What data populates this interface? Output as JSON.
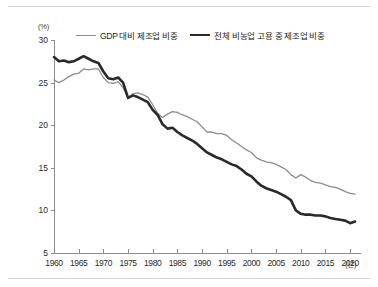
{
  "chart_data": {
    "type": "line",
    "title": "",
    "subtitle": "",
    "xlabel": "(년)",
    "ylabel": "(%)",
    "xlim": [
      1960,
      2022
    ],
    "ylim": [
      5,
      30
    ],
    "xticks": [
      1960,
      1965,
      1970,
      1975,
      1980,
      1985,
      1990,
      1995,
      2000,
      2005,
      2010,
      2015,
      2020
    ],
    "xtick_labels": [
      "1960",
      "1965",
      "1970",
      "1975",
      "1980",
      "1985",
      "1990",
      "1995",
      "2000",
      "2005",
      "2010",
      "2015",
      "2020"
    ],
    "yticks": [
      5,
      10,
      15,
      20,
      25,
      30
    ],
    "ytick_labels": [
      "5",
      "10",
      "15",
      "20",
      "25",
      "30"
    ],
    "grid": false,
    "legend_position": "top-center",
    "series": [
      {
        "name": "GDP 대비 제조업 비중",
        "color": "#8c8c8c",
        "line_width": 1.3,
        "x": [
          1960,
          1961,
          1962,
          1963,
          1964,
          1965,
          1966,
          1967,
          1968,
          1969,
          1970,
          1971,
          1972,
          1973,
          1974,
          1975,
          1976,
          1977,
          1978,
          1979,
          1980,
          1981,
          1982,
          1983,
          1984,
          1985,
          1986,
          1987,
          1988,
          1989,
          1990,
          1991,
          1992,
          1993,
          1994,
          1995,
          1996,
          1997,
          1998,
          1999,
          2000,
          2001,
          2002,
          2003,
          2004,
          2005,
          2006,
          2007,
          2008,
          2009,
          2010,
          2011,
          2012,
          2013,
          2014,
          2015,
          2016,
          2017,
          2018,
          2019,
          2020,
          2021
        ],
        "values": [
          25.3,
          25.0,
          25.3,
          25.7,
          26.0,
          26.1,
          26.6,
          26.5,
          26.6,
          26.6,
          25.6,
          25.0,
          24.9,
          25.1,
          24.4,
          23.2,
          23.7,
          23.8,
          23.6,
          23.3,
          22.4,
          21.4,
          20.9,
          21.3,
          21.6,
          21.5,
          21.2,
          21.0,
          20.7,
          20.4,
          19.8,
          19.2,
          19.2,
          19.0,
          19.0,
          18.8,
          18.3,
          17.9,
          17.5,
          17.1,
          16.8,
          16.2,
          15.9,
          15.7,
          15.6,
          15.4,
          15.1,
          14.8,
          14.2,
          13.8,
          14.2,
          13.9,
          13.5,
          13.3,
          13.2,
          13.0,
          12.8,
          12.7,
          12.5,
          12.2,
          12.0,
          11.9
        ]
      },
      {
        "name": "전체 비농업 고용 중 제조업 비중",
        "color": "#2a2a2a",
        "line_width": 2.6,
        "x": [
          1960,
          1961,
          1962,
          1963,
          1964,
          1965,
          1966,
          1967,
          1968,
          1969,
          1970,
          1971,
          1972,
          1973,
          1974,
          1975,
          1976,
          1977,
          1978,
          1979,
          1980,
          1981,
          1982,
          1983,
          1984,
          1985,
          1986,
          1987,
          1988,
          1989,
          1990,
          1991,
          1992,
          1993,
          1994,
          1995,
          1996,
          1997,
          1998,
          1999,
          2000,
          2001,
          2002,
          2003,
          2004,
          2005,
          2006,
          2007,
          2008,
          2009,
          2010,
          2011,
          2012,
          2013,
          2014,
          2015,
          2016,
          2017,
          2018,
          2019,
          2020,
          2021
        ],
        "values": [
          28.0,
          27.5,
          27.6,
          27.4,
          27.5,
          27.8,
          28.1,
          27.8,
          27.5,
          27.3,
          26.3,
          25.5,
          25.4,
          25.6,
          25.0,
          23.2,
          23.5,
          23.3,
          23.0,
          22.7,
          21.8,
          21.2,
          20.1,
          19.6,
          19.7,
          19.2,
          18.8,
          18.5,
          18.2,
          17.8,
          17.3,
          16.8,
          16.5,
          16.2,
          16.0,
          15.7,
          15.4,
          15.2,
          14.8,
          14.3,
          14.0,
          13.4,
          12.9,
          12.6,
          12.4,
          12.2,
          11.9,
          11.6,
          11.2,
          10.0,
          9.6,
          9.5,
          9.5,
          9.4,
          9.4,
          9.3,
          9.1,
          9.0,
          8.9,
          8.8,
          8.5,
          8.7
        ]
      }
    ]
  },
  "legend": {
    "items": [
      {
        "label": "GDP 대비 제조업 비중",
        "style": "thin"
      },
      {
        "label": "전체 비농업 고용 중 제조업 비중",
        "style": "thick"
      }
    ]
  },
  "axes": {
    "y_unit": "(%)",
    "x_unit": "(년)"
  }
}
